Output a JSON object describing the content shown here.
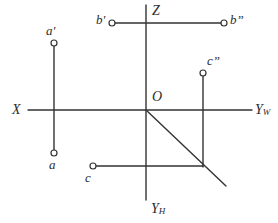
{
  "figure": {
    "type": "descriptive-geometry-projection-diagram",
    "background_color": "#ffffff",
    "line_color": "#333333",
    "width": 278,
    "height": 223,
    "origin": {
      "x": 146,
      "y": 110,
      "label": "O"
    }
  },
  "axes": [
    {
      "name": "z-axis",
      "label": "Z",
      "label_x": 152,
      "label_y": 4,
      "x1": 146,
      "y1": 5,
      "x2": 146,
      "y2": 200
    },
    {
      "name": "x-axis",
      "label": "X",
      "label_x": 12,
      "label_y": 103,
      "x1": 28,
      "y1": 110,
      "x2": 252,
      "y2": 110
    },
    {
      "name": "yw-axis",
      "label": "Y",
      "sublabel": "W",
      "label_x": 255,
      "label_y": 103,
      "x1": 146,
      "y1": 110,
      "x2": 252,
      "y2": 110
    },
    {
      "name": "yh-axis",
      "label": "Y",
      "sublabel": "H",
      "label_x": 151,
      "label_y": 202,
      "x1": 146,
      "y1": 110,
      "x2": 146,
      "y2": 200
    }
  ],
  "points": [
    {
      "id": "a-prime",
      "label": "a'",
      "cx": 54,
      "cy": 43,
      "label_x": 46,
      "label_y": 24
    },
    {
      "id": "a",
      "label": "a",
      "cx": 54,
      "cy": 153,
      "label_x": 49,
      "label_y": 158
    },
    {
      "id": "b-prime",
      "label": "b'",
      "cx": 112,
      "cy": 23,
      "label_x": 96,
      "label_y": 13
    },
    {
      "id": "b-double-prime",
      "label": "b”",
      "cx": 224,
      "cy": 23,
      "label_x": 230,
      "label_y": 13
    },
    {
      "id": "c",
      "label": "c",
      "cx": 93,
      "cy": 166,
      "label_x": 85,
      "label_y": 171
    },
    {
      "id": "c-double-prime",
      "label": "c”",
      "cx": 203,
      "cy": 73,
      "label_x": 207,
      "label_y": 54
    }
  ],
  "projection_lines": [
    {
      "id": "line-a-vertical",
      "x1": 54,
      "y1": 43,
      "x2": 54,
      "y2": 153
    },
    {
      "id": "line-b-horizontal",
      "x1": 112,
      "y1": 23,
      "x2": 224,
      "y2": 23
    },
    {
      "id": "line-c-vertical",
      "x1": 203,
      "y1": 73,
      "x2": 203,
      "y2": 167
    },
    {
      "id": "line-c-horizontal",
      "x1": 93,
      "y1": 166,
      "x2": 203,
      "y2": 166
    }
  ],
  "diagonal": {
    "id": "bisector-diagonal",
    "x1": 146,
    "y1": 110,
    "x2": 226,
    "y2": 186
  }
}
